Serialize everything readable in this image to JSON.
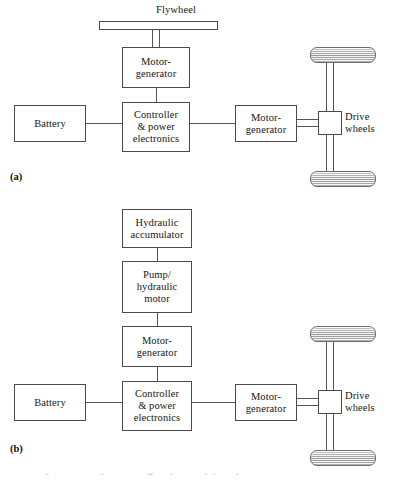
{
  "figure": {
    "panels": [
      {
        "tag": "(a)",
        "nodes": {
          "flywheel_label": "Flywheel",
          "motor_generator_top": "Motor-\ngenerator",
          "battery": "Battery",
          "controller": "Controller\n& power\nelectronics",
          "motor_generator_right": "Motor-\ngenerator",
          "drive_wheels": "Drive\nwheels"
        }
      },
      {
        "tag": "(b)",
        "nodes": {
          "hydraulic_accumulator": "Hydraulic\naccumulator",
          "pump_hydraulic_motor": "Pump/\nhydraulic\nmotor",
          "motor_generator_top": "Motor-\ngenerator",
          "battery": "Battery",
          "controller": "Controller\n& power\nelectronics",
          "motor_generator_right": "Motor-\ngenerator",
          "drive_wheels": "Drive\nwheels"
        }
      }
    ],
    "caption_clipped": "Hybrid drive system using a flywheel (a) or hydraulic",
    "colors": {
      "line": "#555555",
      "box_border": "#4a4a4a",
      "box_fill": "#ffffff",
      "wheel_dark": "#a9a9a9",
      "wheel_light": "#e9e9e9",
      "page_bg": "#ffffff",
      "text": "#161616"
    }
  }
}
